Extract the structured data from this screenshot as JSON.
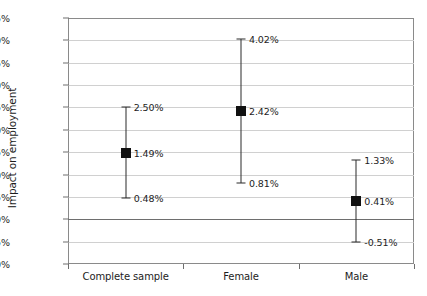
{
  "chart_data": {
    "type": "scatter",
    "title": "",
    "xlabel": "",
    "ylabel": "Impact on employment",
    "categories": [
      "Complete sample",
      "Female",
      "Male"
    ],
    "values": [
      1.49,
      2.42,
      0.41
    ],
    "error_low": [
      0.48,
      0.81,
      -0.51
    ],
    "error_high": [
      2.5,
      4.02,
      1.33
    ],
    "value_labels": [
      "1.49%",
      "2.42%",
      "0.41%"
    ],
    "error_low_labels": [
      "0.48%",
      "0.81%",
      "-0.51%"
    ],
    "error_high_labels": [
      "2.50%",
      "4.02%",
      "1.33%"
    ],
    "ylim": [
      -1.0,
      4.5
    ],
    "ytick_values": [
      4.5,
      4.0,
      3.5,
      3.0,
      2.5,
      2.0,
      1.5,
      1.0,
      0.5,
      0.0,
      -0.5,
      -1.0
    ],
    "ytick_labels": [
      "4.5%",
      "4.0%",
      "3.5%",
      "3.0%",
      "2.5%",
      "2.0%",
      "1.5%",
      "1.0%",
      "0.5%",
      "0.0%",
      "-0.5%",
      "-1.0%"
    ],
    "grid": true,
    "legend": "none",
    "colors": {
      "marker": "#111111",
      "whisker": "#2b2b2b",
      "gridline": "#d0d0d0",
      "zero_line": "#6e6e6e",
      "axis": "#8a8a8a",
      "text": "#1d1d1d",
      "background": "#ffffff"
    }
  }
}
